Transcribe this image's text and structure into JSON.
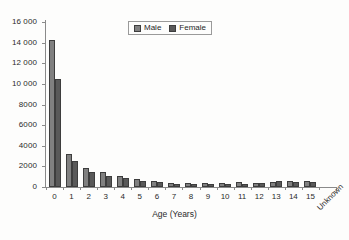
{
  "chart_data": {
    "type": "bar",
    "title": "",
    "xlabel": "Age (Years)",
    "ylabel": "",
    "categories": [
      "0",
      "1",
      "2",
      "3",
      "4",
      "5",
      "6",
      "7",
      "8",
      "9",
      "10",
      "11",
      "12",
      "13",
      "14",
      "15",
      "Unknown"
    ],
    "series": [
      {
        "name": "Male",
        "color": "#808080",
        "values": [
          14300,
          3200,
          1800,
          1450,
          1050,
          780,
          540,
          420,
          370,
          370,
          370,
          470,
          430,
          520,
          580,
          620,
          0
        ]
      },
      {
        "name": "Female",
        "color": "#595959",
        "values": [
          10450,
          2540,
          1420,
          1080,
          900,
          610,
          450,
          340,
          330,
          320,
          320,
          340,
          400,
          560,
          480,
          530,
          0
        ]
      }
    ],
    "ylim": [
      0,
      16000
    ],
    "yticks": [
      0,
      2000,
      4000,
      6000,
      8000,
      10000,
      12000,
      14000,
      16000
    ],
    "ytick_labels": [
      "0",
      "2000",
      "4000",
      "6000",
      "8000",
      "10 000",
      "12 000",
      "14 000",
      "16 000"
    ],
    "grid": false,
    "legend_position": "top-center",
    "legend_entries": [
      "Male",
      "Female"
    ],
    "axis_color": "#8a8a8a",
    "background_color": "#fdfdfc"
  }
}
